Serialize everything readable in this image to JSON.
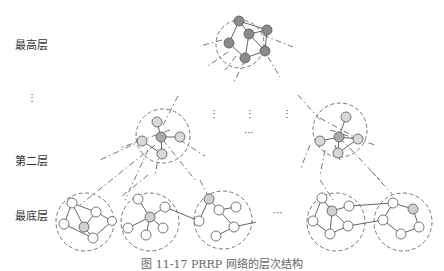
{
  "layers": {
    "top": "最高层",
    "second": "第二层",
    "bottom": "最底层",
    "vertical_ellipsis": "⋮"
  },
  "ellipses": {
    "mid_vertical": [
      "⋮",
      "⋮",
      "⋮"
    ],
    "mid_horizontal": "···",
    "bottom_horizontal": "···"
  },
  "caption": "图 11-17 PRRP 网络的层次结构",
  "colors": {
    "top_node": "#8a8a8a",
    "cluster_head": "#b5b5b5",
    "member_node_mid": "#d8d8d8",
    "member_node_bottom": "#ffffff",
    "stroke": "#555555",
    "dashed": "#666666"
  }
}
